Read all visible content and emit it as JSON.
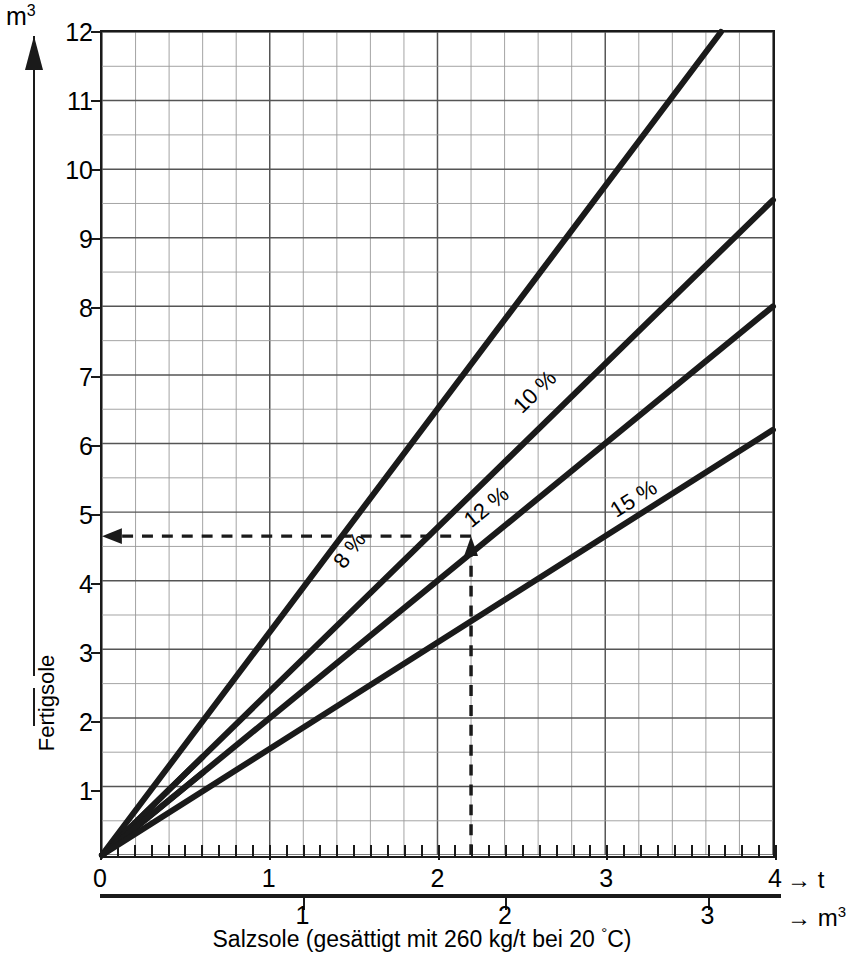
{
  "axes": {
    "y_title": "m",
    "y_title_sup": "3",
    "y_label": "Fertigsole",
    "y_ticks": [
      1,
      2,
      3,
      4,
      5,
      6,
      7,
      8,
      9,
      10,
      11,
      12
    ],
    "x_primary_unit": "t",
    "x_primary_ticks": [
      0,
      1,
      2,
      3,
      4
    ],
    "x_secondary_unit": "m",
    "x_secondary_unit_sup": "3",
    "x_secondary_ticks": [
      1,
      2,
      3
    ],
    "x_arrow_t": "→ t",
    "x_arrow_m3": "→ m",
    "x_caption": "Salzsole (gesättigt mit 260 kg/t bei 20 ",
    "x_caption_deg": "°",
    "x_caption_tail": "C)"
  },
  "chart_data": {
    "type": "line",
    "title": "",
    "xlabel": "Salzsole (gesättigt mit 260 kg/t bei 20 °C)",
    "ylabel": "Fertigsole",
    "xlim": [
      0,
      4
    ],
    "ylim": [
      0,
      12
    ],
    "grid": true,
    "grid_major_x": 1,
    "grid_minor_x": 0.2,
    "grid_major_y": 1,
    "grid_minor_y": 0.5,
    "x_unit": "t",
    "y_unit": "m3",
    "legend": "inline-rotated-labels",
    "series": [
      {
        "name": "8 %",
        "label": "8 %",
        "color": "#1a1a1a",
        "points": [
          [
            0,
            0
          ],
          [
            4,
            13.0
          ]
        ],
        "slope": 3.25,
        "x_start": 0,
        "x_end": 3.69,
        "y_end": 12.0,
        "label_x": 1.45,
        "label_y": 4.3
      },
      {
        "name": "10 %",
        "label": "10 %",
        "color": "#1a1a1a",
        "points": [
          [
            0,
            0
          ],
          [
            4,
            9.55
          ]
        ],
        "slope": 2.3875,
        "x_start": 0,
        "x_end": 4.0,
        "y_end": 9.55,
        "label_x": 2.5,
        "label_y": 6.55,
        "segment_break_x": 0.6
      },
      {
        "name": "12 %",
        "label": "12 %",
        "color": "#1a1a1a",
        "points": [
          [
            0,
            0
          ],
          [
            4,
            8.0
          ]
        ],
        "slope": 2.0,
        "x_start": 0,
        "x_end": 4.0,
        "y_end": 8.0,
        "label_x": 2.2,
        "label_y": 4.9,
        "segment_break_x": 0.6
      },
      {
        "name": "15 %",
        "label": "15 %",
        "color": "#1a1a1a",
        "points": [
          [
            0,
            0
          ],
          [
            4,
            6.2
          ]
        ],
        "slope": 1.55,
        "x_start": 0,
        "x_end": 4.0,
        "y_end": 6.2,
        "label_x": 3.05,
        "label_y": 5.05
      }
    ],
    "annotations": [
      {
        "type": "construction-line",
        "name": "vertical-dashed",
        "x": 2.2,
        "y_from": 0,
        "y_to": 4.65,
        "arrow": "up",
        "style": "dashed"
      },
      {
        "type": "construction-line",
        "name": "horizontal-dashed",
        "y": 4.65,
        "x_from": 2.2,
        "x_to": 0,
        "arrow": "left",
        "style": "dashed"
      }
    ],
    "secondary_x_axis": {
      "unit": "m3",
      "ticks": [
        1,
        2,
        3
      ],
      "tick_positions_in_t": [
        1.2,
        2.4,
        3.6
      ],
      "note": "m3 scale offset from t scale"
    }
  },
  "colors": {
    "ink": "#1a1a1a",
    "grid_major": "#555555",
    "grid_minor": "#999999",
    "background": "#ffffff"
  }
}
